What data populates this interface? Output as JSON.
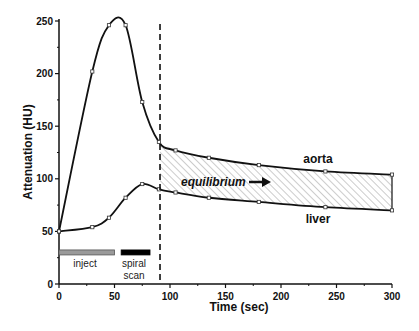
{
  "chart_data": {
    "type": "line",
    "title": "",
    "xlabel": "Time (sec)",
    "ylabel": "Attenuation (HU)",
    "xlim": [
      0,
      300
    ],
    "ylim": [
      0,
      250
    ],
    "xticks": [
      0,
      50,
      100,
      150,
      200,
      250,
      300
    ],
    "yticks": [
      0,
      50,
      100,
      150,
      200,
      250
    ],
    "grid": false,
    "legend": "inline labels",
    "series": [
      {
        "name": "aorta",
        "x": [
          0,
          30,
          45,
          60,
          75,
          90,
          105,
          135,
          180,
          240,
          300
        ],
        "y": [
          50,
          202,
          246,
          246,
          173,
          135,
          127,
          120,
          113,
          107,
          104
        ]
      },
      {
        "name": "liver",
        "x": [
          0,
          30,
          45,
          60,
          75,
          90,
          105,
          135,
          180,
          240,
          300
        ],
        "y": [
          50,
          54,
          63,
          82,
          95,
          90,
          87,
          82,
          78,
          73,
          70
        ]
      }
    ],
    "annotations": [
      {
        "type": "vline",
        "x": 91,
        "style": "dashed"
      },
      {
        "type": "hatched-region",
        "x_from": 91,
        "x_to": 300,
        "between": [
          "aorta",
          "liver"
        ],
        "label": "equilibrium"
      },
      {
        "type": "bar",
        "label": "inject",
        "x_from": 0,
        "x_to": 50,
        "y": 30,
        "color": "#9a9a9a"
      },
      {
        "type": "bar",
        "label": "spiral scan",
        "x_from": 56,
        "x_to": 82,
        "y": 30,
        "color": "#000000"
      }
    ]
  },
  "labels": {
    "xlabel": "Time (sec)",
    "ylabel": "Attenuation (HU)",
    "aorta": "aorta",
    "liver": "liver",
    "equilibrium": "equilibrium",
    "inject": "inject",
    "spiral_1": "spiral",
    "spiral_2": "scan"
  },
  "colors": {
    "line": "#111111",
    "hatch": "#9a9a9a",
    "inject_bar": "#a0a0a0",
    "scan_bar": "#000000"
  }
}
